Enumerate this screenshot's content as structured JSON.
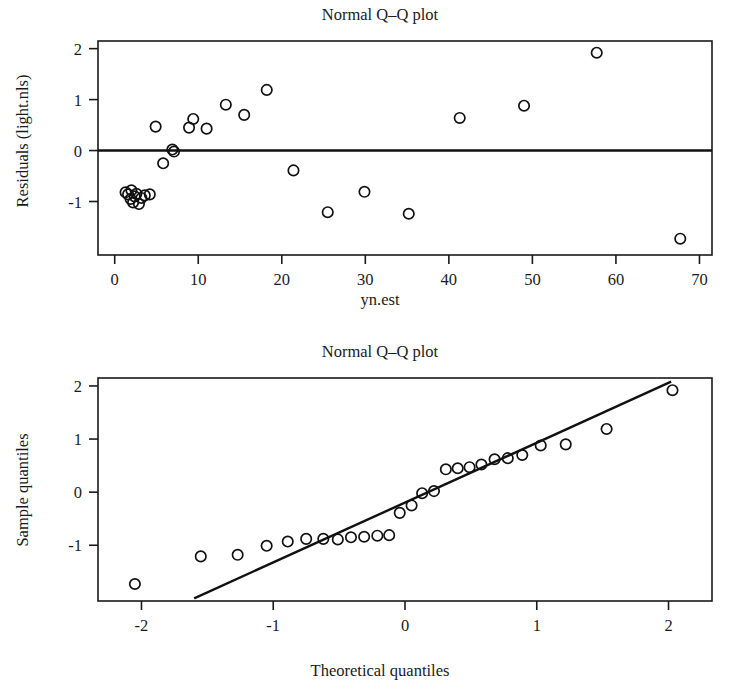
{
  "figure": {
    "background_color": "#ffffff",
    "foreground_color": "#1a1a1a",
    "width": 731,
    "height": 689
  },
  "chart_data": [
    {
      "type": "scatter",
      "panel": "top",
      "title": "Normal Q–Q plot",
      "xlabel": "yn.est",
      "ylabel": "Residuals (light.nls)",
      "xlim": [
        -2.0,
        71.5
      ],
      "ylim": [
        -2.05,
        2.15
      ],
      "xticks": [
        0,
        10,
        20,
        30,
        40,
        50,
        60,
        70
      ],
      "xticklabels": [
        "0",
        "10",
        "20",
        "30",
        "40",
        "50",
        "60",
        "70"
      ],
      "yticks": [
        -1,
        0,
        1,
        2
      ],
      "yticklabels": [
        "-1",
        "0",
        "1",
        "2"
      ],
      "grid": false,
      "legend": "none",
      "annotations": [
        "horizontal reference line at y = 0"
      ],
      "reference_lines": [
        {
          "orientation": "horizontal",
          "y": 0
        }
      ],
      "x": [
        1.3,
        1.6,
        1.9,
        2.0,
        2.2,
        2.4,
        2.6,
        2.9,
        3.2,
        3.6,
        4.2,
        4.9,
        5.8,
        6.9,
        7.1,
        8.9,
        9.4,
        11.0,
        13.3,
        15.5,
        18.2,
        21.4,
        25.5,
        29.9,
        35.2,
        41.3,
        49.0,
        57.7,
        67.7
      ],
      "y": [
        -0.82,
        -0.86,
        -0.95,
        -0.78,
        -1.02,
        -0.9,
        -0.85,
        -1.05,
        -0.93,
        -0.88,
        -0.86,
        0.47,
        -0.25,
        0.02,
        -0.02,
        0.45,
        0.62,
        0.43,
        0.9,
        0.7,
        1.19,
        -0.39,
        -1.21,
        -0.81,
        -1.24,
        0.64,
        0.88,
        1.92,
        -1.73
      ]
    },
    {
      "type": "scatter",
      "panel": "bottom",
      "title": "Normal Q–Q plot",
      "xlabel": "Theoretical quantiles",
      "ylabel": "Sample quantiles",
      "xlim": [
        -2.33,
        2.33
      ],
      "ylim": [
        -2.05,
        2.15
      ],
      "xticks": [
        -2,
        -1,
        0,
        1,
        2
      ],
      "xticklabels": [
        "-2",
        "-1",
        "0",
        "1",
        "2"
      ],
      "yticks": [
        -1,
        0,
        1,
        2
      ],
      "yticklabels": [
        "-1",
        "0",
        "1",
        "2"
      ],
      "grid": false,
      "legend": "none",
      "annotations": [
        "qqline reference line through the first and third quartiles"
      ],
      "reference_lines": [
        {
          "orientation": "diagonal",
          "x1": -1.6,
          "y1": -2.0,
          "x2": 2.02,
          "y2": 2.08
        }
      ],
      "x": [
        -2.05,
        -1.55,
        -1.27,
        -1.05,
        -0.89,
        -0.75,
        -0.62,
        -0.51,
        -0.41,
        -0.31,
        -0.21,
        -0.12,
        -0.04,
        0.05,
        0.13,
        0.22,
        0.31,
        0.4,
        0.49,
        0.58,
        0.68,
        0.78,
        0.89,
        1.03,
        1.22,
        1.53,
        2.03
      ],
      "y": [
        -1.73,
        -1.21,
        -1.18,
        -1.01,
        -0.93,
        -0.88,
        -0.88,
        -0.89,
        -0.85,
        -0.84,
        -0.82,
        -0.81,
        -0.39,
        -0.25,
        -0.02,
        0.02,
        0.43,
        0.45,
        0.47,
        0.52,
        0.62,
        0.64,
        0.7,
        0.88,
        0.9,
        1.19,
        1.92
      ]
    }
  ]
}
